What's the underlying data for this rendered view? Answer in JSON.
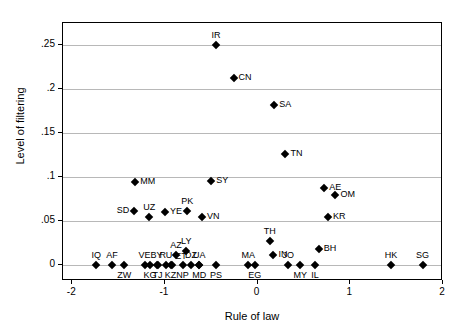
{
  "chart_data": {
    "type": "scatter",
    "title": "",
    "xlabel": "Rule of law",
    "ylabel": "Level of filtering",
    "xlim": [
      -2.1,
      2.0
    ],
    "ylim": [
      -0.018,
      0.275
    ],
    "grid": "horizontal",
    "legend": "none",
    "xticks": [
      -2,
      -1,
      0,
      1,
      2
    ],
    "xtick_labels": [
      "-2",
      "-1",
      "0",
      "1",
      "2"
    ],
    "yticks": [
      0,
      0.05,
      0.1,
      0.15,
      0.2,
      0.25
    ],
    "ytick_labels": [
      "0",
      ".05",
      ".1",
      ".15",
      ".2",
      ".25"
    ],
    "points": [
      {
        "label": "IR",
        "x": -0.45,
        "y": 0.25,
        "pos": "above"
      },
      {
        "label": "CN",
        "x": -0.26,
        "y": 0.212,
        "pos": "right"
      },
      {
        "label": "SA",
        "x": 0.18,
        "y": 0.182,
        "pos": "right"
      },
      {
        "label": "TN",
        "x": 0.3,
        "y": 0.126,
        "pos": "right"
      },
      {
        "label": "MM",
        "x": -1.32,
        "y": 0.094,
        "pos": "right"
      },
      {
        "label": "SY",
        "x": -0.5,
        "y": 0.095,
        "pos": "right"
      },
      {
        "label": "AE",
        "x": 0.72,
        "y": 0.088,
        "pos": "right"
      },
      {
        "label": "OM",
        "x": 0.84,
        "y": 0.08,
        "pos": "right"
      },
      {
        "label": "SD",
        "x": -1.33,
        "y": 0.062,
        "pos": "left"
      },
      {
        "label": "UZ",
        "x": -1.17,
        "y": 0.055,
        "pos": "above"
      },
      {
        "label": "YE",
        "x": -1.0,
        "y": 0.06,
        "pos": "right"
      },
      {
        "label": "PK",
        "x": -0.76,
        "y": 0.062,
        "pos": "above"
      },
      {
        "label": "VN",
        "x": -0.6,
        "y": 0.055,
        "pos": "right"
      },
      {
        "label": "KR",
        "x": 0.76,
        "y": 0.055,
        "pos": "right"
      },
      {
        "label": "TH",
        "x": 0.13,
        "y": 0.027,
        "pos": "above"
      },
      {
        "label": "BH",
        "x": 0.66,
        "y": 0.018,
        "pos": "right"
      },
      {
        "label": "IN",
        "x": 0.17,
        "y": 0.012,
        "pos": "right"
      },
      {
        "label": "AZ",
        "x": -0.88,
        "y": 0.012,
        "pos": "above"
      },
      {
        "label": "LY",
        "x": -0.77,
        "y": 0.016,
        "pos": "above"
      },
      {
        "label": "IQ",
        "x": -1.74,
        "y": 0.0,
        "pos": "above"
      },
      {
        "label": "AF",
        "x": -1.57,
        "y": 0.0,
        "pos": "above"
      },
      {
        "label": "ZW",
        "x": -1.44,
        "y": 0.0,
        "pos": "below"
      },
      {
        "label": "VE",
        "x": -1.22,
        "y": 0.0,
        "pos": "above"
      },
      {
        "label": "KG",
        "x": -1.16,
        "y": 0.0,
        "pos": "below"
      },
      {
        "label": "BY",
        "x": -1.09,
        "y": 0.0,
        "pos": "above"
      },
      {
        "label": "TJ",
        "x": -1.08,
        "y": 0.0,
        "pos": "below"
      },
      {
        "label": "RU",
        "x": -0.99,
        "y": 0.0,
        "pos": "above"
      },
      {
        "label": "KZ",
        "x": -0.94,
        "y": 0.0,
        "pos": "below"
      },
      {
        "label": "ET",
        "x": -0.92,
        "y": 0.0,
        "pos": "aboveright"
      },
      {
        "label": "NP",
        "x": -0.81,
        "y": 0.0,
        "pos": "below"
      },
      {
        "label": "DZ",
        "x": -0.72,
        "y": 0.0,
        "pos": "above"
      },
      {
        "label": "UA",
        "x": -0.63,
        "y": 0.0,
        "pos": "above"
      },
      {
        "label": "MD",
        "x": -0.63,
        "y": 0.0,
        "pos": "below"
      },
      {
        "label": "PS",
        "x": -0.45,
        "y": 0.0,
        "pos": "below"
      },
      {
        "label": "MA",
        "x": -0.1,
        "y": 0.0,
        "pos": "above"
      },
      {
        "label": "EG",
        "x": -0.03,
        "y": 0.0,
        "pos": "below"
      },
      {
        "label": "JO",
        "x": 0.33,
        "y": 0.0,
        "pos": "above"
      },
      {
        "label": "MY",
        "x": 0.46,
        "y": 0.0,
        "pos": "below"
      },
      {
        "label": "IL",
        "x": 0.62,
        "y": 0.0,
        "pos": "below"
      },
      {
        "label": "HK",
        "x": 1.44,
        "y": 0.0,
        "pos": "above"
      },
      {
        "label": "SG",
        "x": 1.78,
        "y": 0.0,
        "pos": "above"
      }
    ]
  }
}
